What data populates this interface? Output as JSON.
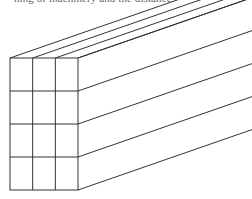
{
  "page": {
    "width": 252,
    "height": 199,
    "background_color": "#ffffff"
  },
  "caption": {
    "text": "ning or machinery and the distance",
    "note": "clipped line of body text at very top of crop; only bottom of glyphs visible"
  },
  "figure": {
    "line_color": "#333333",
    "line_width": 1,
    "fill_color": "none",
    "projection": "oblique (cavalier)",
    "front_face": {
      "columns": 3,
      "rows": 4,
      "cells": 12,
      "left": 10,
      "top": 58,
      "right": 78,
      "bottom": 190,
      "cell_width": 22.67,
      "cell_height": 33
    },
    "receding": {
      "direction": "up-and-right",
      "dx": 196,
      "dy": -68,
      "angle_degrees": -19,
      "clipped_at_right_edge": true
    },
    "top_face_strips": 3,
    "side_face_strips": 4
  },
  "chart_data": {
    "type": "diagram",
    "subtitle": "",
    "xlabel": "",
    "ylabel": "",
    "grid": false,
    "legend": "none",
    "geometry": {
      "shape": "rectangular prism (beam stack)",
      "front_face_columns": 3,
      "front_face_rows": 4,
      "front_face_cells": 12,
      "visible_top_strips": 3,
      "visible_side_strips": 4,
      "front_face_rect": {
        "x": 10,
        "y": 58,
        "w": 68,
        "h": 132
      },
      "recede_vector": {
        "dx": 196,
        "dy": -68
      }
    },
    "annotations": []
  }
}
